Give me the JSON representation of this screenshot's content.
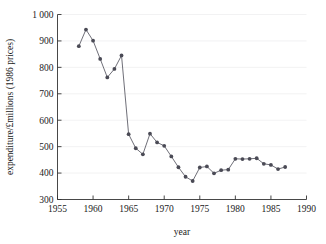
{
  "chart_data": {
    "type": "line",
    "title": "",
    "xlabel": "year",
    "ylabel": "expenditure/£millions (1986 prices)",
    "xlim": [
      1955,
      1990
    ],
    "ylim": [
      300,
      1000
    ],
    "xticks": [
      1955,
      1960,
      1965,
      1970,
      1975,
      1980,
      1985,
      1990
    ],
    "xtick_labels": [
      "1955",
      "1960",
      "1965",
      "1970",
      "1975",
      "1980",
      "1985",
      "1990"
    ],
    "yticks": [
      300,
      400,
      500,
      600,
      700,
      800,
      900,
      1000
    ],
    "ytick_labels": [
      "300",
      "400",
      "500",
      "600",
      "700",
      "800",
      "900",
      "1 000"
    ],
    "grid": "horizontal",
    "legend": "none",
    "marker": "filled-circle",
    "series": [
      {
        "name": "expenditure",
        "x": [
          1958,
          1959,
          1960,
          1961,
          1962,
          1963,
          1964,
          1965,
          1966,
          1967,
          1968,
          1969,
          1970,
          1971,
          1972,
          1973,
          1974,
          1975,
          1976,
          1977,
          1978,
          1979,
          1980,
          1981,
          1982,
          1983,
          1984,
          1985,
          1986,
          1987
        ],
        "values": [
          880,
          943,
          901,
          832,
          762,
          794,
          845,
          547,
          494,
          471,
          549,
          516,
          503,
          463,
          422,
          386,
          370,
          421,
          425,
          399,
          411,
          413,
          454,
          453,
          454,
          456,
          435,
          431,
          415,
          423
        ]
      }
    ]
  },
  "axes": {
    "x_axis_label": "year",
    "y_axis_label": "expenditure/£millions (1986 prices)"
  }
}
